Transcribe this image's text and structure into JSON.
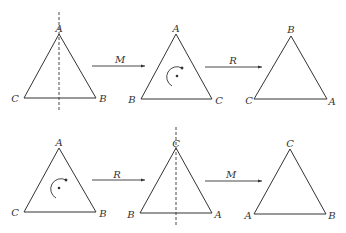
{
  "diagram": {
    "colors": {
      "stroke": "#333333",
      "background": "#ffffff"
    },
    "rows": [
      {
        "name": "M-then-R",
        "triangles": [
          {
            "apex": "A",
            "bottom_left": "C",
            "bottom_right": "B",
            "marker": "mirror-axis"
          },
          {
            "apex": "A",
            "bottom_left": "B",
            "bottom_right": "C",
            "marker": "rotation"
          },
          {
            "apex": "B",
            "bottom_left": "C",
            "bottom_right": "A",
            "marker": "none"
          }
        ],
        "arrows": [
          {
            "label": "M"
          },
          {
            "label": "R"
          }
        ]
      },
      {
        "name": "R-then-M",
        "triangles": [
          {
            "apex": "A",
            "bottom_left": "C",
            "bottom_right": "B",
            "marker": "rotation"
          },
          {
            "apex": "C",
            "bottom_left": "B",
            "bottom_right": "A",
            "marker": "mirror-axis"
          },
          {
            "apex": "C",
            "bottom_left": "A",
            "bottom_right": "B",
            "marker": "none"
          }
        ],
        "arrows": [
          {
            "label": "R"
          },
          {
            "label": "M"
          }
        ]
      }
    ]
  }
}
